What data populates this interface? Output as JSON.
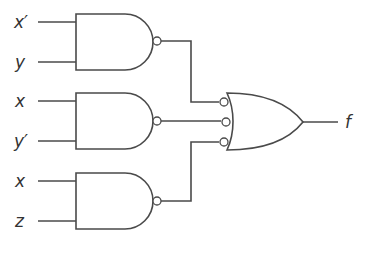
{
  "diagram": {
    "type": "logic-circuit",
    "colors": {
      "stroke": "#4a4a4a",
      "text": "#333333",
      "background": "#ffffff"
    },
    "inputs": [
      {
        "label": "x′",
        "gate": 1
      },
      {
        "label": "y",
        "gate": 1
      },
      {
        "label": "x",
        "gate": 2
      },
      {
        "label": "y′",
        "gate": 2
      },
      {
        "label": "x",
        "gate": 3
      },
      {
        "label": "z",
        "gate": 3
      }
    ],
    "gates": [
      {
        "id": 1,
        "kind": "NAND",
        "inputs": [
          "x′",
          "y"
        ]
      },
      {
        "id": 2,
        "kind": "NAND",
        "inputs": [
          "x",
          "y′"
        ]
      },
      {
        "id": 3,
        "kind": "NAND",
        "inputs": [
          "x",
          "z"
        ]
      },
      {
        "id": 4,
        "kind": "OR with inverted inputs",
        "inputs": [
          "gate1",
          "gate2",
          "gate3"
        ]
      }
    ],
    "output": {
      "label": "f"
    }
  }
}
